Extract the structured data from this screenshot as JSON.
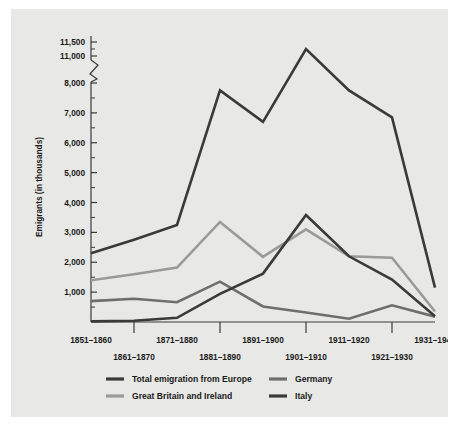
{
  "figure": {
    "background_color": "#e8e8e6",
    "page_background": "#ffffff"
  },
  "chart_data": {
    "type": "line",
    "title": "",
    "xlabel": "",
    "ylabel": "Emigrants (in thousands)",
    "categories": [
      "1851–1860",
      "1861–1870",
      "1871–1880",
      "1881–1890",
      "1891–1900",
      "1901–1910",
      "1911–1920",
      "1921–1930",
      "1931–1940"
    ],
    "ytick_labels": [
      "1,000",
      "2,000",
      "3,000",
      "4,000",
      "5,000",
      "6,000",
      "7,000",
      "8,000",
      "11,000",
      "11,500"
    ],
    "ytick_values": [
      1000,
      2000,
      3000,
      4000,
      5000,
      6000,
      7000,
      8000,
      11000,
      11500
    ],
    "yminor_values": [
      500,
      1500,
      2500,
      3500,
      4500,
      5500,
      6500,
      7500,
      11250
    ],
    "ylim": [
      0,
      11500
    ],
    "axis_break": {
      "present": true,
      "between": [
        8000,
        11000
      ]
    },
    "grid": false,
    "legend_position": "bottom",
    "series": [
      {
        "name": "Total emigration from Europe",
        "color": "#3a3a3a",
        "width": 2.6,
        "values": [
          2300,
          2750,
          3250,
          7750,
          6700,
          11250,
          7750,
          6850,
          1150
        ]
      },
      {
        "name": "Great Britain and Ireland",
        "color": "#9a9a9a",
        "width": 2.6,
        "values": [
          1400,
          1600,
          1820,
          3350,
          2180,
          3100,
          2200,
          2150,
          350
        ]
      },
      {
        "name": "Germany",
        "color": "#6e6e6e",
        "width": 2.6,
        "values": [
          700,
          780,
          660,
          1350,
          520,
          320,
          110,
          560,
          180
        ]
      },
      {
        "name": "Italy",
        "color": "#3a3a3a",
        "width": 2.6,
        "values": [
          20,
          40,
          140,
          940,
          1620,
          3580,
          2200,
          1420,
          190
        ]
      }
    ]
  },
  "legend": {
    "entries": [
      {
        "label": "Total emigration from Europe",
        "color": "#3a3a3a"
      },
      {
        "label": "Germany",
        "color": "#6e6e6e"
      },
      {
        "label": "Great Britain and Ireland",
        "color": "#9a9a9a"
      },
      {
        "label": "Italy",
        "color": "#3a3a3a"
      }
    ]
  }
}
